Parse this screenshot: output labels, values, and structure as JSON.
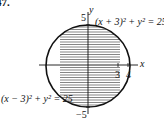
{
  "problem_number": "47.",
  "axes": {
    "x_label": "x",
    "y_label": "y"
  },
  "ticks": {
    "y_top": "5",
    "y_bottom": "−5",
    "x_3": "3",
    "x_4": "4"
  },
  "curves": {
    "right_label": "(x + 3)² + y² = 25",
    "left_label": "(x − 3)² + y² = 25"
  },
  "region": {
    "fill": "horizontal hatching",
    "color": "#111111"
  }
}
